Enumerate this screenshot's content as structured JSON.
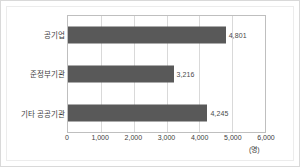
{
  "chart_data": {
    "type": "bar",
    "orientation": "horizontal",
    "title": "",
    "subtitle": "",
    "categories": [
      "공기업",
      "준정부기관",
      "기타 공공기관"
    ],
    "values": [
      4801,
      3216,
      4245
    ],
    "value_labels": [
      "4,801",
      "3,216",
      "4,245"
    ],
    "xlabel": "",
    "ylabel": "",
    "unit_label": "(명)",
    "xlim": [
      0,
      6000
    ],
    "xticks": [
      0,
      1000,
      2000,
      3000,
      4000,
      5000,
      6000
    ],
    "xtick_labels": [
      "0",
      "1,000",
      "2,000",
      "3,000",
      "4,000",
      "5,000",
      "6,000"
    ],
    "grid": true,
    "grid_axis": "x",
    "legend": false,
    "series": [
      {
        "name": "인원",
        "values": [
          4801,
          3216,
          4245
        ]
      }
    ],
    "colors": {
      "bar": "#595959",
      "grid": "#d9d9d9",
      "plot_border": "#bfbfbf",
      "frame": "#d9d9d9",
      "text": "#3d3d3d",
      "background": "#ffffff"
    }
  }
}
